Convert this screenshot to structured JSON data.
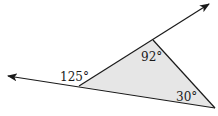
{
  "diagram": {
    "type": "triangle-exterior-angle",
    "colors": {
      "stroke": "#1a1a1a",
      "fill": "#e6e6e6",
      "background": "#ffffff"
    },
    "vertices": {
      "left": {
        "x": 79,
        "y": 86
      },
      "top": {
        "x": 153,
        "y": 40
      },
      "right": {
        "x": 215,
        "y": 108
      }
    },
    "rays": [
      {
        "name": "left-ray",
        "from": "right",
        "through": "left",
        "tip": {
          "x": 7,
          "y": 76
        }
      },
      {
        "name": "upper-right-ray",
        "from": "left",
        "through": "top",
        "tip": {
          "x": 210,
          "y": 3
        }
      }
    ],
    "labels": {
      "exterior_angle": "125°",
      "top_angle": "92°",
      "right_angle": "30°"
    }
  }
}
